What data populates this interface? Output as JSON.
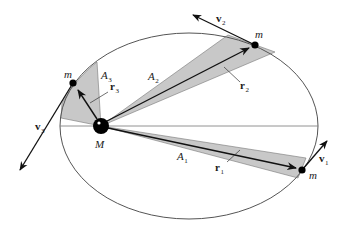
{
  "diagram": {
    "colors": {
      "orbit": "#555555",
      "sector_fill": "#c8c8c8",
      "sector_edge": "#777777",
      "vector": "#111111",
      "mass": "#000000",
      "background": "#ffffff"
    },
    "central_body": {
      "label": "M"
    },
    "positions": [
      {
        "id": "1",
        "mass_label": "m",
        "radius_label": "r",
        "radius_sub": "1",
        "velocity_label": "v",
        "velocity_sub": "1",
        "area_label": "A",
        "area_sub": "1"
      },
      {
        "id": "2",
        "mass_label": "m",
        "radius_label": "r",
        "radius_sub": "2",
        "velocity_label": "v",
        "velocity_sub": "2",
        "area_label": "A",
        "area_sub": "2"
      },
      {
        "id": "3",
        "mass_label": "m",
        "radius_label": "r",
        "radius_sub": "3",
        "velocity_label": "v",
        "velocity_sub": "3",
        "area_label": "A",
        "area_sub": "3"
      }
    ]
  }
}
